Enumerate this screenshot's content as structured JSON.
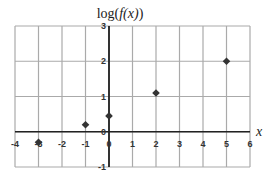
{
  "chart_data": {
    "type": "scatter",
    "title": "log(f(x))",
    "title_parts": {
      "prefix": "log(",
      "italic": "f(x)",
      "suffix": ")"
    },
    "xlabel": "x",
    "ylabel": "log(f(x))",
    "xlim": [
      -4,
      6
    ],
    "ylim": [
      -1,
      3
    ],
    "x_ticks": [
      "-4",
      "-3",
      "-2",
      "-1",
      "0",
      "1",
      "2",
      "3",
      "4",
      "5",
      "6"
    ],
    "y_ticks": [
      "-1",
      "0",
      "1",
      "2",
      "3"
    ],
    "grid": true,
    "legend": null,
    "marker": "diamond",
    "marker_color": "#333333",
    "series": [
      {
        "name": "log(f(x))",
        "x": [
          -3,
          -1,
          0,
          2,
          5
        ],
        "y": [
          -0.3,
          0.2,
          0.45,
          1.1,
          2.0
        ]
      }
    ]
  },
  "colors": {
    "grid": "#aaaaaa",
    "axis": "#222222",
    "marker": "#333333"
  }
}
